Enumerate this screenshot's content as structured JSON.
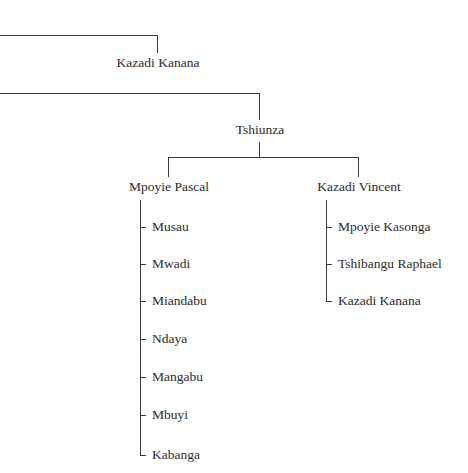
{
  "diagram": {
    "type": "family-tree",
    "colors": {
      "line": "#3a3a3a",
      "text": "#2b2b2b",
      "background": "#ffffff"
    },
    "nodes": {
      "kazadi_kanana_top": "Kazadi Kanana",
      "tshiunza": "Tshiunza",
      "mpoyie_pascal": "Mpoyie Pascal",
      "kazadi_vincent": "Kazadi Vincent"
    },
    "mpoyie_pascal_children": [
      "Musau",
      "Mwadi",
      "Miandabu",
      "Ndaya",
      "Mangabu",
      "Mbuyi",
      "Kabanga"
    ],
    "kazadi_vincent_children": [
      "Mpoyie Kasonga",
      "Tshibangu Raphael",
      "Kazadi Kanana"
    ]
  }
}
